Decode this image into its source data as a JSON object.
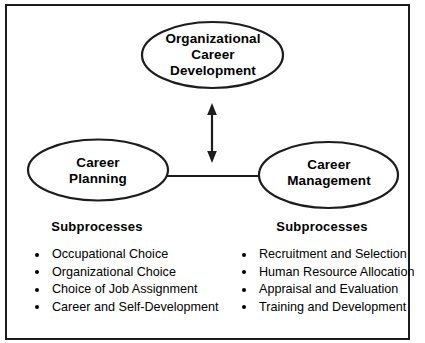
{
  "diagram": {
    "title_nodes": {
      "top": {
        "name": "organizational-career-development",
        "lines": [
          "Organizational",
          "Career",
          "Development"
        ]
      },
      "left": {
        "name": "career-planning",
        "lines": [
          "Career",
          "Planning"
        ]
      },
      "right": {
        "name": "career-management",
        "lines": [
          "Career",
          "Management"
        ]
      }
    },
    "connectors": [
      {
        "name": "vertical-double-arrow",
        "type": "double-headed-arrow",
        "from": "organizational-career-development",
        "to": "horizontal-connector"
      },
      {
        "name": "horizontal-connector",
        "type": "line",
        "from": "career-planning",
        "to": "career-management"
      }
    ],
    "columns": {
      "left": {
        "heading": "Subprocesses",
        "items": [
          "Occupational Choice",
          "Organizational Choice",
          "Choice of Job Assignment",
          "Career and Self-Development"
        ]
      },
      "right": {
        "heading": "Subprocesses",
        "items": [
          "Recruitment and Selection",
          "Human Resource Allocation",
          "Appraisal and Evaluation",
          "Training and Development"
        ]
      }
    },
    "colors": {
      "stroke": "#1c1c1c",
      "text": "#000000",
      "background": "#ffffff"
    }
  }
}
